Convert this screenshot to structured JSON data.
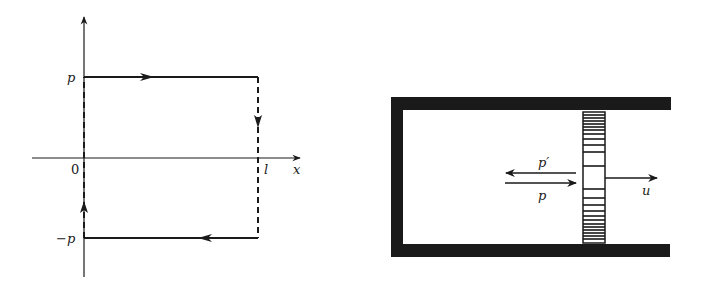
{
  "left_diagram": {
    "title": "phase-space trajectory",
    "axis_x_label": "x",
    "origin_label": "0",
    "x_mark_label": "l",
    "y_top_label": "p",
    "y_bottom_label": "−p",
    "path": [
      {
        "segment": "top",
        "from": "(0,p)",
        "to": "(l,p)",
        "style": "solid",
        "direction": "right"
      },
      {
        "segment": "right",
        "from": "(l,p)",
        "to": "(l,-p)",
        "style": "dashed",
        "direction": "down"
      },
      {
        "segment": "bottom",
        "from": "(l,-p)",
        "to": "(0,-p)",
        "style": "solid",
        "direction": "left"
      },
      {
        "segment": "left",
        "from": "(0,-p)",
        "to": "(0,p)",
        "style": "dashed",
        "direction": "up"
      }
    ]
  },
  "right_diagram": {
    "title": "particle in cylinder with moving piston",
    "incoming_momentum_label": "p",
    "reflected_momentum_label": "p′",
    "piston_velocity_label": "u"
  },
  "colors": {
    "ink": "#1a1a1a",
    "background": "#ffffff"
  }
}
